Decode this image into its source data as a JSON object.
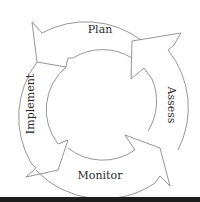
{
  "diagram": {
    "type": "cycle",
    "stages": [
      {
        "id": "plan",
        "label": "Plan"
      },
      {
        "id": "assess",
        "label": "Assess"
      },
      {
        "id": "monitor",
        "label": "Monitor"
      },
      {
        "id": "implement",
        "label": "Implement"
      }
    ],
    "flow": "Plan → Implement → Monitor → Assess → Plan",
    "colors": {
      "line": "#8a8a8a",
      "text": "#2a2a2a",
      "background": "#ffffff",
      "rule": "#1c1c1c"
    }
  }
}
